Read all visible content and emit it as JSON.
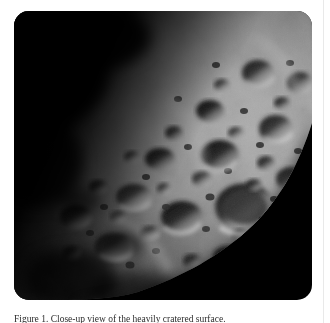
{
  "page": {
    "background_color": "#ffffff",
    "column_rule_color": "#e9e9e9"
  },
  "figure": {
    "alt_name": "cratered-moon-surface-photograph",
    "space_color": "#000000",
    "shadow_color": "#050505",
    "highlight_color": "#d8d8d8",
    "midtone_color": "#8e8e8e",
    "corner_radius": "15px"
  },
  "caption": {
    "text": "Figure 1. Close-up view of the heavily cratered surface."
  }
}
